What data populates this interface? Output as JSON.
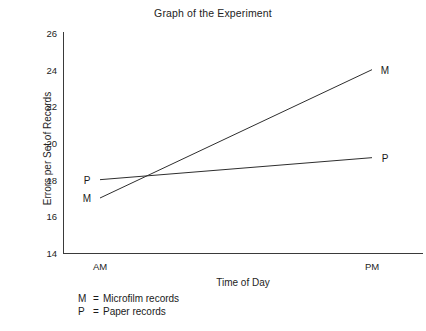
{
  "chart_data": {
    "type": "line",
    "title": "Graph of the Experiment",
    "xlabel": "Time of Day",
    "ylabel": "Errors per Set of Records",
    "categories": [
      "AM",
      "PM"
    ],
    "x": [
      0,
      1
    ],
    "ylim": [
      14,
      26
    ],
    "yticks": [
      14,
      16,
      18,
      20,
      22,
      24,
      26
    ],
    "ytick_labels": [
      "14",
      "16",
      "18",
      "20",
      "22",
      "24",
      "26"
    ],
    "xtick_labels": [
      "AM",
      "PM"
    ],
    "grid": false,
    "legend_position": "below-axis-left",
    "series": [
      {
        "name": "M",
        "label": "Microfilm records",
        "values": [
          17.0,
          24.0
        ],
        "point_labels": [
          "M",
          "M"
        ],
        "color": "#2e2e2e"
      },
      {
        "name": "P",
        "label": "Paper records",
        "values": [
          18.0,
          19.2
        ],
        "point_labels": [
          "P",
          "P"
        ],
        "color": "#2e2e2e"
      }
    ],
    "annotations": [
      {
        "text": "M",
        "x": 0,
        "y": 17.0,
        "position": "left"
      },
      {
        "text": "P",
        "x": 0,
        "y": 18.0,
        "position": "left"
      },
      {
        "text": "M",
        "x": 1,
        "y": 24.0,
        "position": "right"
      },
      {
        "text": "P",
        "x": 1,
        "y": 19.2,
        "position": "right"
      }
    ]
  },
  "legend": {
    "rows": [
      {
        "key": "M",
        "eq": "=",
        "desc": "Microfilm records"
      },
      {
        "key": "P",
        "eq": "=",
        "desc": "Paper records"
      }
    ]
  }
}
